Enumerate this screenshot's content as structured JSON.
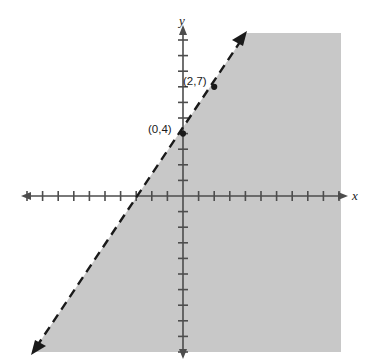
{
  "figure": {
    "kind": "coordinate-plane-inequality-graph",
    "width": 371,
    "height": 363,
    "background_color": "#ffffff",
    "shade_color": "#c8c8c8",
    "ink_color": "#1a1a1a",
    "axis_color": "#4d4d4d"
  },
  "axes": {
    "x_label": "x",
    "y_label": "y",
    "origin_px": [
      183,
      196
    ],
    "unit_px": 15.6,
    "x_axis_y_px": 196,
    "y_axis_x_px": 183,
    "x_range_px": [
      24,
      345
    ],
    "y_range_px": [
      28,
      356
    ],
    "x_tick_count_left": 10,
    "x_tick_count_right": 10,
    "y_tick_count_up": 10,
    "y_tick_count_down": 10,
    "arrows": [
      "left",
      "right",
      "up",
      "down"
    ]
  },
  "labels": {
    "point_1": "(0,4)",
    "point_2": "(2,7)"
  },
  "chart_data": {
    "type": "line",
    "title": "",
    "xlabel": "x",
    "ylabel": "y",
    "grid": false,
    "legend": null,
    "xlim": [
      -10.2,
      10.4
    ],
    "ylim": [
      -10.5,
      10.8
    ],
    "boundary_line": {
      "style": "dashed",
      "strict": true,
      "slope": 1.5,
      "intercept": 4,
      "equation": "y = 1.5x + 4",
      "points": [
        {
          "label": "(0,4)",
          "x": 0,
          "y": 4,
          "marked": true
        },
        {
          "label": "(2,7)",
          "x": 2,
          "y": 7,
          "marked": true
        }
      ],
      "endpoints_px": [
        [
          33,
          352
        ],
        [
          246,
          33
        ]
      ],
      "arrowheads": [
        "start",
        "end"
      ]
    },
    "shaded_region": {
      "side": "right-below-of-line",
      "description": "Region to the right of / below the dashed boundary line, shaded gray",
      "inequality": "y < 1.5x + 4",
      "color": "#c8c8c8"
    },
    "annotations": [
      {
        "text": "(0,4)",
        "x": 0,
        "y": 4
      },
      {
        "text": "(2,7)",
        "x": 2,
        "y": 7
      }
    ]
  }
}
